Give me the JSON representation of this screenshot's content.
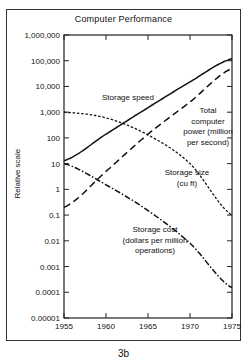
{
  "figure": {
    "title": "Computer Performance",
    "caption": "3b"
  },
  "chart_data": {
    "type": "line",
    "title": "Computer Performance",
    "xlabel": "",
    "ylabel": "Relative scale",
    "yscale": "log",
    "ylim": [
      1e-05,
      1000000
    ],
    "xlim": [
      1955,
      1975
    ],
    "grid": false,
    "legend": "none (inline annotations)",
    "x_ticks": [
      "1955",
      "1960",
      "1965",
      "1970",
      "1975"
    ],
    "y_ticks": [
      "1,000,000",
      "100,000",
      "10,000",
      "1,000",
      "100",
      "10",
      "1",
      "0.1",
      "0.01",
      "0.001",
      "0.0001",
      "0.00001"
    ],
    "x": [
      1955,
      1960,
      1965,
      1970,
      1975
    ],
    "series": [
      {
        "name": "Storage speed",
        "style": "solid",
        "values": [
          13,
          140,
          1500,
          15000,
          120000
        ]
      },
      {
        "name": "Total computer power (million per second)",
        "style": "long-dash",
        "values": [
          0.2,
          5,
          140,
          2500,
          50000
        ]
      },
      {
        "name": "Storage size (cu ft)",
        "style": "short-dash",
        "values": [
          1000,
          600,
          130,
          10,
          0.1
        ]
      },
      {
        "name": "Storage cost (dollars per million operations)",
        "style": "dash-dot",
        "values": [
          10,
          1.5,
          0.15,
          0.008,
          0.00015
        ]
      }
    ],
    "annotations": [
      {
        "text": "Storage speed",
        "lines": [
          "Storage speed"
        ]
      },
      {
        "text": "Total computer power (million per second)",
        "lines": [
          "Total",
          "computer",
          "power (million",
          "per second)"
        ]
      },
      {
        "text": "Storage size (cu ft)",
        "lines": [
          "Storage size",
          "(cu ft)"
        ]
      },
      {
        "text": "Storage cost (dollars per million operations)",
        "lines": [
          "Storage cost",
          "(dollars per million",
          "operations)"
        ]
      }
    ]
  }
}
